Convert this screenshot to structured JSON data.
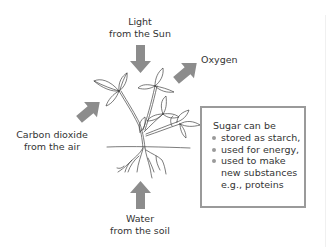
{
  "diagram": {
    "labels": {
      "light": [
        "Light",
        "from the Sun"
      ],
      "oxygen": [
        "Oxygen"
      ],
      "carbon_dioxide": [
        "Carbon dioxide",
        "from the air"
      ],
      "water": [
        "Water",
        "from the soil"
      ]
    },
    "arrows": [
      {
        "name": "light-arrow",
        "direction": "down",
        "meaning": "input"
      },
      {
        "name": "oxygen-arrow",
        "direction": "up-right",
        "meaning": "output"
      },
      {
        "name": "carbon-dioxide-arrow",
        "direction": "up-right",
        "meaning": "input"
      },
      {
        "name": "water-arrow",
        "direction": "up",
        "meaning": "input"
      }
    ],
    "sugar_box": {
      "title": "Sugar can be",
      "items": [
        {
          "lines": [
            "stored as starch,"
          ]
        },
        {
          "lines": [
            "used for energy,"
          ]
        },
        {
          "lines": [
            "used to make",
            "new substances",
            "e.g., proteins"
          ]
        }
      ]
    },
    "colors": {
      "arrow": "#8c8c8c",
      "box_border": "#9a9a9a",
      "bullet": "#9a9a9a",
      "text": "#333333",
      "plant_line": "#444444"
    }
  }
}
